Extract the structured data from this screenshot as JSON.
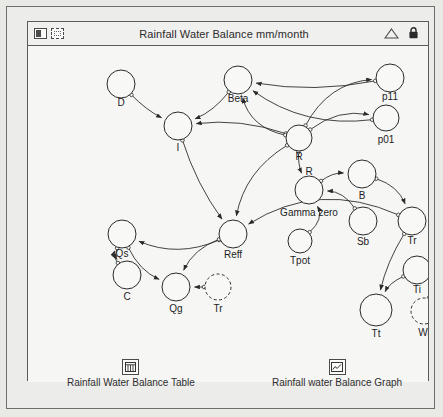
{
  "window": {
    "title": "Rainfall Water Balance mm/month",
    "left_icons": [
      {
        "name": "model-layer-icon",
        "glyph": "stack"
      },
      {
        "name": "interface-layer-icon",
        "glyph": "dotted"
      }
    ],
    "right_icons": [
      {
        "name": "triangle-expand-icon",
        "glyph": "triangle"
      },
      {
        "name": "lock-icon",
        "glyph": "lock"
      }
    ]
  },
  "diagram": {
    "type": "stock-and-flow-causal-loop",
    "nodes": [
      {
        "id": "D",
        "label": "D",
        "x": 93,
        "y": 62,
        "r": 14,
        "style": "solid",
        "label_dx": 0,
        "label_dy": 19
      },
      {
        "id": "Beta",
        "label": "Beta",
        "x": 210,
        "y": 58,
        "r": 14,
        "style": "solid",
        "label_dx": 0,
        "label_dy": 19
      },
      {
        "id": "p11",
        "label": "p11",
        "x": 362,
        "y": 56,
        "r": 14,
        "style": "solid",
        "label_dx": 0,
        "label_dy": 19
      },
      {
        "id": "p01",
        "label": "p01",
        "x": 358,
        "y": 96,
        "r": 13,
        "style": "solid",
        "label_dx": 0,
        "label_dy": 22
      },
      {
        "id": "I",
        "label": "I",
        "x": 150,
        "y": 104,
        "r": 14,
        "style": "solid",
        "label_dx": 0,
        "label_dy": 22
      },
      {
        "id": "R_top",
        "label": "R",
        "x": 271,
        "y": 116,
        "r": 13,
        "style": "solid",
        "label_dx": 0,
        "label_dy": 19
      },
      {
        "id": "R_mid",
        "label": "R",
        "x": 281,
        "y": 168,
        "r": 14,
        "style": "solid",
        "label_dx": 0,
        "label_dy": -18
      },
      {
        "id": "GammaZero",
        "label": "Gamma zero",
        "x": 281,
        "y": 168,
        "r": 0,
        "style": "label",
        "label_dx": 0,
        "label_dy": 23
      },
      {
        "id": "B",
        "label": "B",
        "x": 334,
        "y": 152,
        "r": 14,
        "style": "solid",
        "label_dx": 0,
        "label_dy": 22
      },
      {
        "id": "Sb",
        "label": "Sb",
        "x": 335,
        "y": 199,
        "r": 14,
        "style": "solid",
        "label_dx": 0,
        "label_dy": 21
      },
      {
        "id": "Tr_right",
        "label": "Tr",
        "x": 384,
        "y": 199,
        "r": 14,
        "style": "solid",
        "label_dx": 0,
        "label_dy": 20
      },
      {
        "id": "Tpot",
        "label": "Tpot",
        "x": 272,
        "y": 219,
        "r": 12,
        "style": "solid",
        "label_dx": 0,
        "label_dy": 20
      },
      {
        "id": "Reff",
        "label": "Reff",
        "x": 205,
        "y": 212,
        "r": 14,
        "style": "solid",
        "label_dx": 0,
        "label_dy": 21
      },
      {
        "id": "Qs",
        "label": "Qs",
        "x": 94,
        "y": 212,
        "r": 14,
        "style": "solid",
        "label_dx": 0,
        "label_dy": 20
      },
      {
        "id": "C",
        "label": "C",
        "x": 99,
        "y": 253,
        "r": 14,
        "style": "solid",
        "label_dx": 0,
        "label_dy": 22
      },
      {
        "id": "Qg",
        "label": "Qg",
        "x": 148,
        "y": 265,
        "r": 14,
        "style": "solid",
        "label_dx": 0,
        "label_dy": 22
      },
      {
        "id": "Tr_ghost",
        "label": "Tr",
        "x": 190,
        "y": 265,
        "r": 13,
        "style": "dashed",
        "label_dx": 0,
        "label_dy": 22
      },
      {
        "id": "Ti",
        "label": "Ti",
        "x": 389,
        "y": 248,
        "r": 14,
        "style": "solid",
        "label_dx": 0,
        "label_dy": 20
      },
      {
        "id": "Wi",
        "label": "Wi",
        "x": 396,
        "y": 289,
        "r": 13,
        "style": "dashed",
        "label_dx": 0,
        "label_dy": 22
      },
      {
        "id": "Tt",
        "label": "Tt",
        "x": 348,
        "y": 288,
        "r": 16,
        "style": "solid",
        "label_dx": 0,
        "label_dy": 24
      }
    ],
    "links": [
      {
        "from": "D",
        "to": "I"
      },
      {
        "from": "Beta",
        "to": "I"
      },
      {
        "from": "R_top",
        "to": "I"
      },
      {
        "from": "R_top",
        "to": "Beta"
      },
      {
        "from": "p11",
        "to": "Beta"
      },
      {
        "from": "p01",
        "to": "Beta"
      },
      {
        "from": "R_top",
        "to": "p11"
      },
      {
        "from": "R_top",
        "to": "p01"
      },
      {
        "from": "I",
        "to": "Reff"
      },
      {
        "from": "R_top",
        "to": "Reff"
      },
      {
        "from": "R_top",
        "to": "R_mid"
      },
      {
        "from": "R_mid",
        "to": "B"
      },
      {
        "from": "B",
        "to": "Tr_right"
      },
      {
        "from": "Sb",
        "to": "R_mid"
      },
      {
        "from": "Tpot",
        "to": "R_mid"
      },
      {
        "from": "Reff",
        "to": "Qs"
      },
      {
        "from": "Qs",
        "to": "C"
      },
      {
        "from": "C",
        "to": "Qs"
      },
      {
        "from": "Reff",
        "to": "Qg"
      },
      {
        "from": "Qs",
        "to": "Qg"
      },
      {
        "from": "Tr_ghost",
        "to": "Qg"
      },
      {
        "from": "Tr_right",
        "to": "Tt"
      },
      {
        "from": "Ti",
        "to": "Tt"
      },
      {
        "from": "Wi",
        "to": "Ti"
      },
      {
        "from": "Tr_right",
        "to": "Reff"
      }
    ]
  },
  "launchers": [
    {
      "id": "table",
      "icon": "table-icon",
      "label": "Rainfall Water Balance Table"
    },
    {
      "id": "graph",
      "icon": "graph-icon",
      "label": "Rainfall water Balance Graph"
    }
  ],
  "colors": {
    "ink": "#1d1d1d",
    "frame": "#5b5b5b",
    "canvas": "#f6f6f5",
    "window": "#ececeb"
  }
}
